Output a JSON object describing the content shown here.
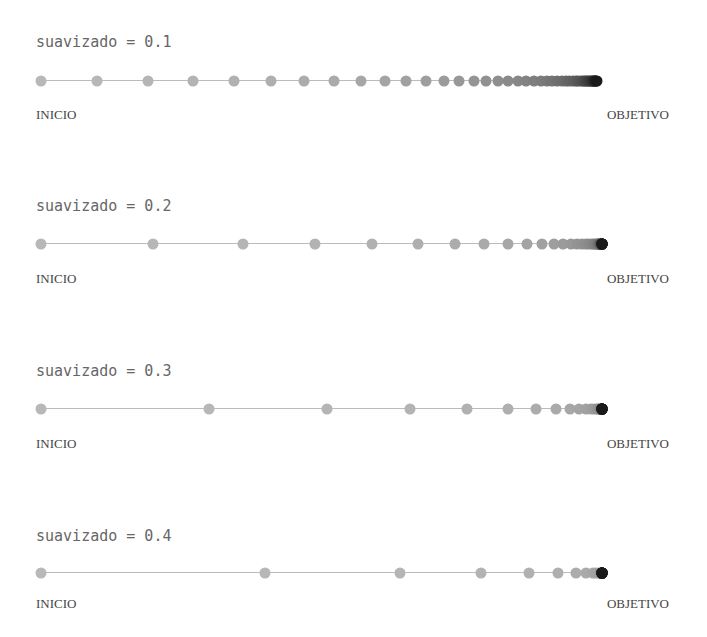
{
  "start_label": "INICIO",
  "end_label": "OBJETIVO",
  "start_x": 41,
  "target_x": 602,
  "dot_count": 45,
  "panels": [
    {
      "title": "suavizado = 0.1",
      "smoothing": 0.1,
      "title_y": 33,
      "line_y": 80,
      "label_y": 107
    },
    {
      "title": "suavizado = 0.2",
      "smoothing": 0.2,
      "title_y": 197,
      "line_y": 243,
      "label_y": 271
    },
    {
      "title": "suavizado = 0.3",
      "smoothing": 0.3,
      "title_y": 362,
      "line_y": 408,
      "label_y": 436
    },
    {
      "title": "suavizado = 0.4",
      "smoothing": 0.4,
      "title_y": 527,
      "line_y": 572,
      "label_y": 596
    }
  ],
  "colors": {
    "dot_start": "#b8b8b8",
    "dot_end": "#1a1a1a",
    "line": "#bbbbbb"
  }
}
